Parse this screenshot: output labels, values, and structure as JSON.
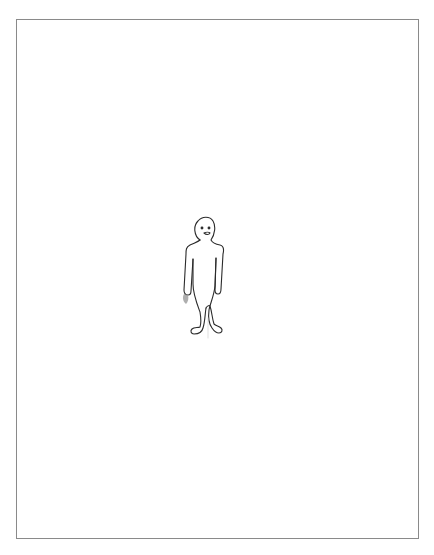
{
  "drawing": {
    "subject": "stick-figure-person",
    "style": "pencil line drawing",
    "colors": {
      "background": "#ffffff",
      "border": "#8a8a8a",
      "stroke": "#2b2b2b",
      "shade": "#9a9a9a"
    }
  }
}
